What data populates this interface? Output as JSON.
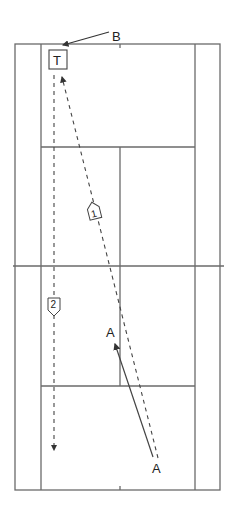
{
  "diagram": {
    "labels": {
      "player_b": "B",
      "target": "T",
      "player_a_start": "A",
      "player_a_end": "A",
      "shot_1": "1",
      "shot_2": "2"
    },
    "colors": {
      "court_lines": "#555555",
      "paths": "#444444",
      "text": "#222222"
    }
  }
}
